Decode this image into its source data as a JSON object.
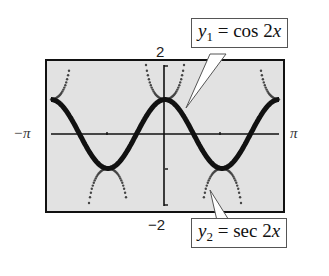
{
  "chart_data": {
    "type": "line",
    "title": "",
    "xlabel": "",
    "ylabel": "",
    "xlim": [
      -3.14159,
      3.14159
    ],
    "ylim": [
      -2,
      2
    ],
    "x_tick_labels": {
      "left": "−π",
      "right": "π"
    },
    "y_tick_labels": {
      "top": "2",
      "bottom": "−2"
    },
    "x_ticks": [
      -1.5708,
      1.5708
    ],
    "y_ticks": [
      -1,
      1
    ],
    "grid": false,
    "series": [
      {
        "name": "y1 = cos 2x",
        "function": "cos(2x)",
        "style": "thick solid",
        "color": "#111111",
        "x": [
          -3.14,
          -2.36,
          -1.57,
          -0.79,
          0,
          0.79,
          1.57,
          2.36,
          3.14
        ],
        "values": [
          1,
          0,
          -1,
          0,
          1,
          0,
          -1,
          0,
          1
        ]
      },
      {
        "name": "y2 = sec 2x",
        "function": "sec(2x)",
        "style": "dotted",
        "color": "#555555",
        "x": [
          -3.14,
          -2.8,
          -1.57,
          -1.2,
          -0.35,
          0,
          0.35,
          1.2,
          1.57,
          1.95,
          2.8,
          3.14
        ],
        "values": [
          1,
          1.3,
          -1,
          -1.4,
          1.3,
          1,
          1.3,
          -1.4,
          -1,
          -1.4,
          1.3,
          1
        ]
      }
    ],
    "annotations": [
      {
        "label_var": "y",
        "label_sub": "1",
        "label_rest": " = cos 2x",
        "points_to": "y1 curve"
      },
      {
        "label_var": "y",
        "label_sub": "2",
        "label_rest": " = sec 2x",
        "points_to": "y2 curve"
      }
    ]
  },
  "labels": {
    "y_max": "2",
    "y_min": "−2",
    "x_min": "−π",
    "x_max": "π",
    "callout1": {
      "var": "y",
      "sub": "1",
      "eq": " = cos 2",
      "x": "x"
    },
    "callout2": {
      "var": "y",
      "sub": "2",
      "eq": " = sec 2",
      "x": "x"
    }
  }
}
